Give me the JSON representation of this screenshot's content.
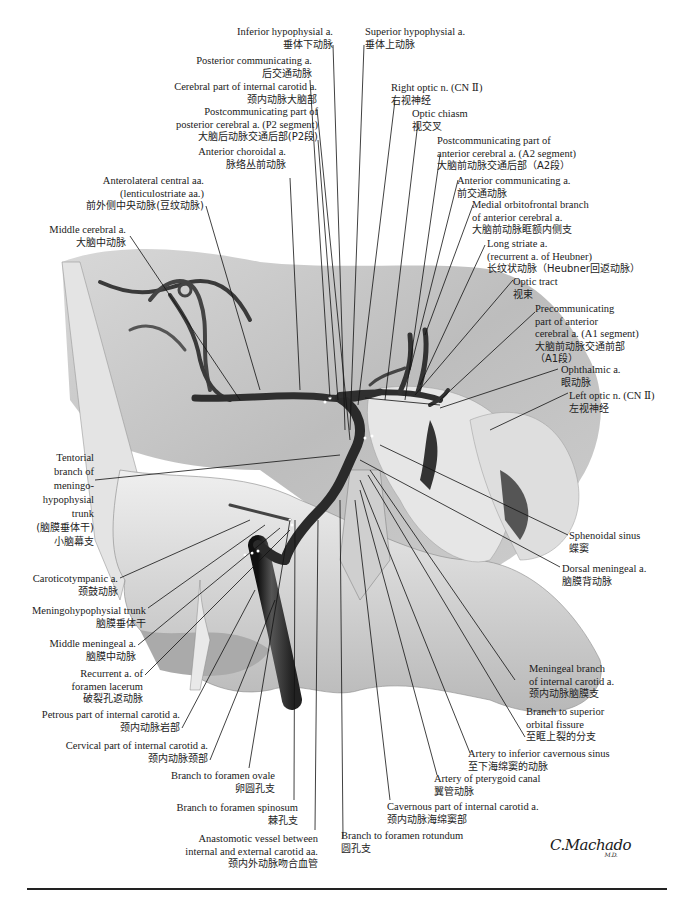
{
  "figure": {
    "signature": "C.Machado",
    "signature_suffix": "M.D.",
    "colors": {
      "background": "#ffffff",
      "text": "#1a1a1a",
      "artery": "#3a3a3a",
      "tissue": "#c9c9c9",
      "bone": "#e8e8e8",
      "leader": "#111111"
    }
  },
  "labels_top_left": [
    {
      "en": "Inferior hypophysial a.",
      "zh": "垂体下动脉"
    },
    {
      "en": "Posterior communicating a.",
      "zh": "后交通动脉"
    },
    {
      "en": "Cerebral part of internal carotid a.",
      "zh": "颈内动脉大脑部"
    },
    {
      "en": "Postcommunicating part of",
      "en2": "posterior cerebral a. (P2 segment)",
      "zh": "大脑后动脉交通后部(P2段)"
    },
    {
      "en": "Anterior choroidal a.",
      "zh": "脉络丛前动脉"
    },
    {
      "en": "Anterolateral central aa.",
      "en2": "(lenticulostriate aa.)",
      "zh": "前外侧中央动脉(豆纹动脉)"
    },
    {
      "en": "Middle cerebral a.",
      "zh": "大脑中动脉"
    }
  ],
  "labels_top_right": [
    {
      "en": "Superior hypophysial a.",
      "zh": "垂体上动脉"
    },
    {
      "en": "Right optic n. (CN Ⅱ)",
      "zh": "右视神经"
    },
    {
      "en": "Optic chiasm",
      "zh": "视交叉"
    },
    {
      "en": "Postcommunicating part of",
      "en2": "anterior cerebral a. (A2 segment)",
      "zh": "大脑前动脉交通后部（A2段）"
    },
    {
      "en": "Anterior communicating a.",
      "zh": "前交通动脉"
    },
    {
      "en": "Medial orbitofrontal branch",
      "en2": "of anterior cerebral a.",
      "zh": "大脑前动脉眶额内侧支"
    },
    {
      "en": "Long striate a.",
      "en2": "(recurrent a. of Heubner)",
      "zh": "长纹状动脉（Heubner回返动脉）"
    },
    {
      "en": "Optic tract",
      "zh": "视束"
    },
    {
      "en": "Precommunicating",
      "en2": "part of anterior",
      "en3": "cerebral a. (A1 segment)",
      "zh": "大脑前动脉交通前部",
      "zh2": "（A1段）"
    },
    {
      "en": "Ophthalmic a.",
      "zh": "眼动脉"
    },
    {
      "en": "Left optic n. (CN Ⅱ)",
      "zh": "左视神经"
    }
  ],
  "labels_left": [
    {
      "en": "Tentorial",
      "en2": "branch of",
      "en3": "meningo-",
      "en4": "hypophysial",
      "en5": "trunk",
      "zh": "(脑膜垂体干)",
      "zh2": "小脑幕支"
    },
    {
      "en": "Caroticotympanic a.",
      "zh": "颈鼓动脉"
    },
    {
      "en": "Meningohypophysial trunk",
      "zh": "脑膜垂体干"
    },
    {
      "en": "Middle meningeal a.",
      "zh": "脑膜中动脉"
    },
    {
      "en": "Recurrent a. of",
      "en2": "foramen lacerum",
      "zh": "破裂孔返动脉"
    },
    {
      "en": "Petrous part of internal carotid a.",
      "zh": "颈内动脉岩部"
    },
    {
      "en": "Cervical part of internal carotid a.",
      "zh": "颈内动脉颈部"
    }
  ],
  "labels_bottom": [
    {
      "en": "Branch to foramen ovale",
      "zh": "卵圆孔支"
    },
    {
      "en": "Branch to foramen spinosum",
      "zh": "棘孔支"
    },
    {
      "en": "Anastomotic vessel between",
      "en2": "internal and external carotid aa.",
      "zh": "颈内外动脉吻合血管"
    },
    {
      "en": "Branch to foramen rotundum",
      "zh": "圆孔支"
    },
    {
      "en": "Cavernous part of internal carotid a.",
      "zh": "颈内动脉海绵窦部"
    },
    {
      "en": "Artery of pterygoid canal",
      "zh": "翼管动脉"
    },
    {
      "en": "Artery to inferior cavernous sinus",
      "zh": "至下海绵窦的动脉"
    }
  ],
  "labels_right": [
    {
      "en": "Sphenoidal sinus",
      "zh": "蝶窦"
    },
    {
      "en": "Dorsal meningeal a.",
      "zh": "脑膜背动脉"
    },
    {
      "en": "Meningeal branch",
      "en2": "of internal carotid a.",
      "zh": "颈内动脉脑膜支"
    },
    {
      "en": "Branch to superior",
      "en2": "orbital fissure",
      "zh": "至眶上裂的分支"
    }
  ]
}
